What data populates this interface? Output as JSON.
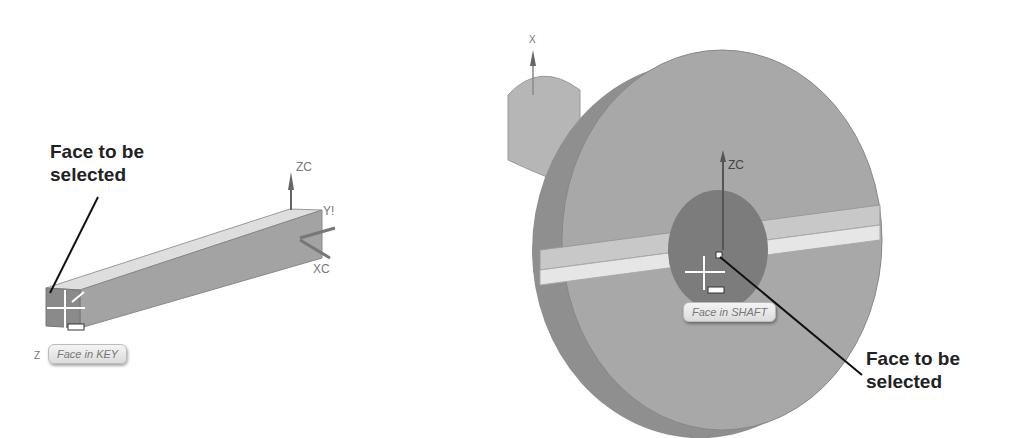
{
  "left_panel": {
    "callout": {
      "line1": "Face to be",
      "line2": "selected"
    },
    "tooltip": "Face in KEY",
    "axes": {
      "z": "ZC",
      "y": "Y!",
      "x": "XC",
      "corner_z": "Z"
    }
  },
  "right_panel": {
    "callout": {
      "line1": "Face to be",
      "line2": "selected"
    },
    "tooltip": "Face in SHAFT",
    "axes": {
      "x_top": "X",
      "z": "ZC"
    }
  },
  "colors": {
    "part_face": "#a9a9a9",
    "part_top": "#d6d6d6",
    "part_side": "#8c8c8c",
    "leader": "#111111"
  }
}
